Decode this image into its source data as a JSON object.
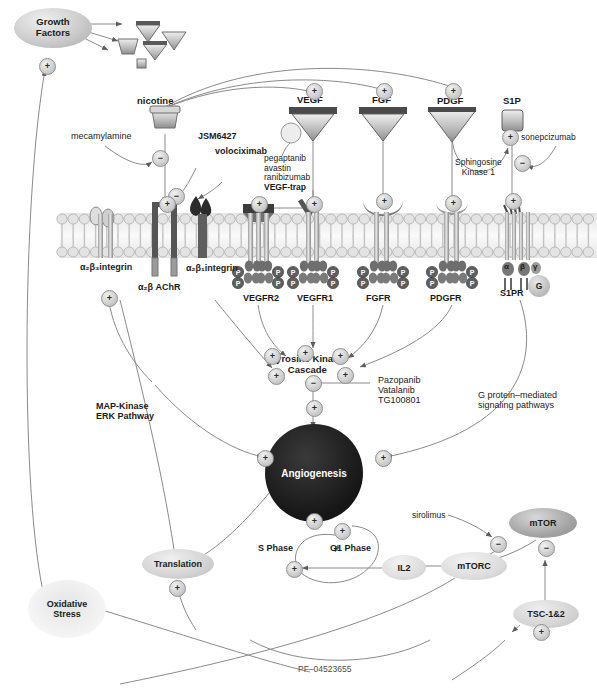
{
  "diagram": {
    "footnote": "PF–04523655"
  },
  "nodes": {
    "growth_factors": "Growth\nFactors",
    "angiogenesis": "Angiogenesis",
    "translation": "Translation",
    "oxidative_stress": "Oxidative\nStress",
    "mtor": "mTOR",
    "mtorc": "mTORC",
    "tsc": "TSC-1&2",
    "il2": "IL2",
    "g_protein": "G"
  },
  "ligands": {
    "nicotine": "nicotine",
    "vegf": "VEGF",
    "fgf": "FGF",
    "pdgf": "PDGF",
    "s1p": "S1P"
  },
  "receptors": {
    "integrin_a2b3": "α₂β₃integrin",
    "achr": "α₂β AChR",
    "integrin_a2b1": "α₂β₁integrin",
    "vegfr2": "VEGFR2",
    "vegfr1": "VEGFR1",
    "fgfr": "FGFR",
    "pdgfr": "PDGFR",
    "s1pr": "S1PR",
    "subunit_alpha": "α",
    "subunit_beta": "β",
    "subunit_gamma": "γ",
    "phosphate": "P"
  },
  "drugs": {
    "mecamylamine": "mecamylamine",
    "jsm6427": "JSM6427",
    "volociximab": "volociximab",
    "vegf_blockers": "pegaptanib\navastin\nranibizumab\nVEGF-trap",
    "vegf_blockers_lines": [
      "pegaptanib",
      "avastin",
      "ranibizumab",
      "VEGF-trap"
    ],
    "sonepcizumab": "sonepcizumab",
    "tk_inhibitors_lines": [
      "Pazopanib",
      "Vatalanib",
      "TG100801"
    ],
    "sirolimus": "sirolimus"
  },
  "pathways": {
    "sphingosine_kinase": "Sphingosine\nKinase 1",
    "sphingosine_kinase_lines": [
      "Sphingosine",
      "Kinase 1"
    ],
    "tyrosine_kinase": "Tyrosine Kinase\nCascade",
    "tyrosine_kinase_lines": [
      "Tyrosine Kinase",
      "Cascade"
    ],
    "map_kinase_lines": [
      "MAP-Kinase",
      "ERK Pathway"
    ],
    "g_protein_lines": [
      "G protein–mediated",
      "signaling pathways"
    ],
    "s_phase": "S Phase",
    "g1_phase": "G1 Phase"
  },
  "signs": {
    "activate": "+",
    "inhibit": "−"
  },
  "colors": {
    "angiogenesis_fill": "#1d1d1d",
    "node_fill": "#cfcfcf",
    "membrane": "#d8d8d8",
    "line": "#7d7d7d",
    "text": "#1a1a1a"
  }
}
